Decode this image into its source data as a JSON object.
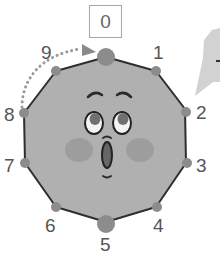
{
  "diagram": {
    "type": "decagon-clock-face",
    "highlight_label": "0",
    "vertex_labels": [
      "0",
      "1",
      "2",
      "3",
      "4",
      "5",
      "6",
      "7",
      "8",
      "9"
    ],
    "arrow": {
      "from": "8",
      "to": "0",
      "style": "dotted-curved"
    },
    "speech_bubble_visible": true,
    "colors": {
      "face_fill": "#b0b0b0",
      "outline": "#2e2e2e",
      "vertex_dot": "#8c8c8c",
      "cheek": "#9c9c9c",
      "arrow": "#9a9a9a",
      "bubble": "#cfcfcf",
      "label": "#555555"
    }
  }
}
